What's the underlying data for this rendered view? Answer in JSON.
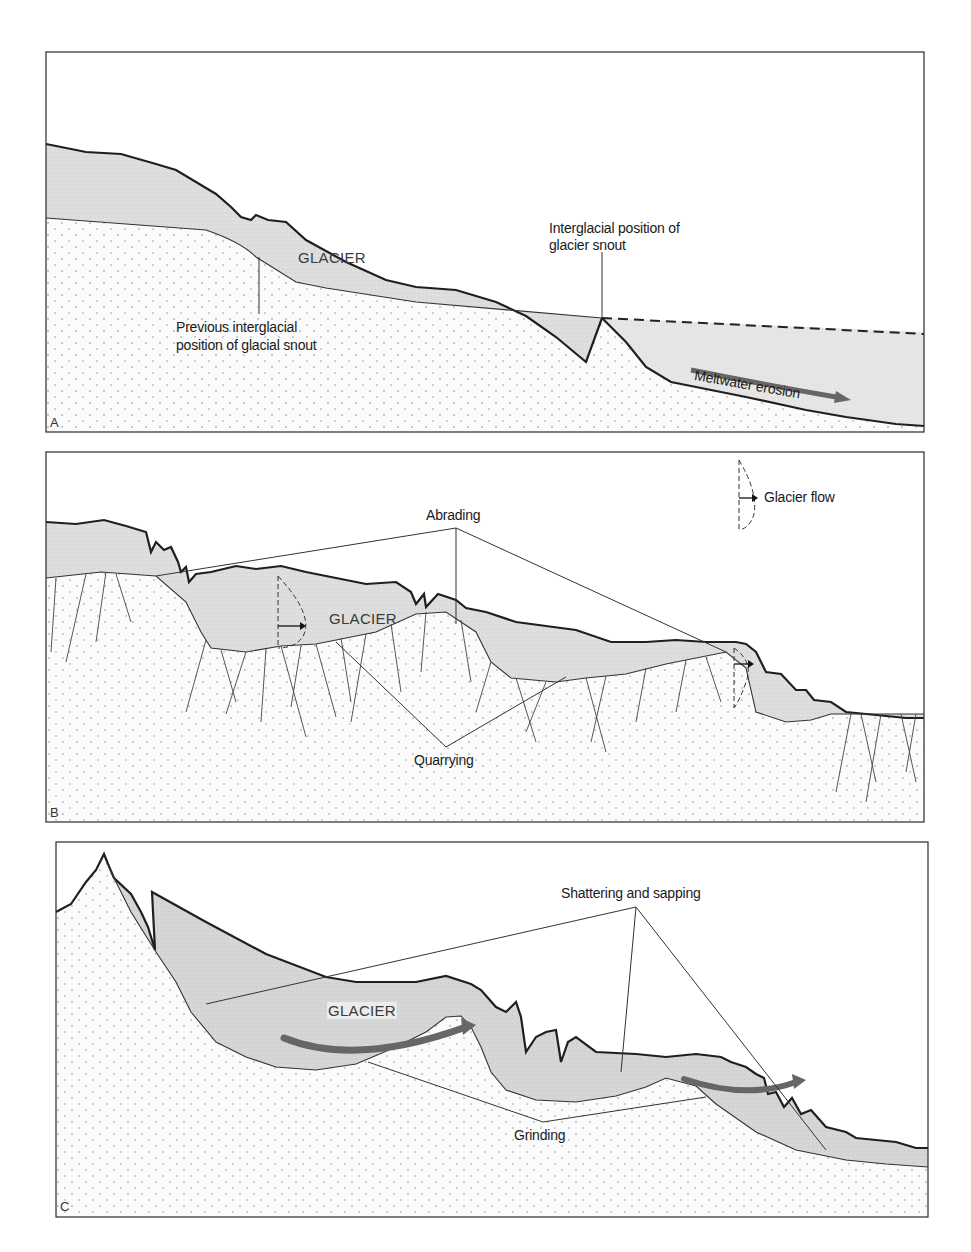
{
  "figure": {
    "colors": {
      "glacier_fill": "#dcdcdc",
      "rock_fill": "#fbfbfb",
      "rock_dots": "#7a7a7a",
      "line": "#1f1f1f",
      "arrow": "#6a6a6a"
    },
    "panels": [
      {
        "id": "A",
        "letter": "A",
        "glacier_label": "GLACIER",
        "annotations": {
          "interglacial_snout_line1": "Interglacial position of",
          "interglacial_snout_line2": "glacier snout",
          "previous_snout_line1": "Previous interglacial",
          "previous_snout_line2": "position of glacial snout",
          "meltwater": "Meltwater erosion"
        }
      },
      {
        "id": "B",
        "letter": "B",
        "glacier_label": "GLACIER",
        "annotations": {
          "abrading": "Abrading",
          "quarrying": "Quarrying",
          "legend_glacier_flow": "Glacier flow"
        }
      },
      {
        "id": "C",
        "letter": "C",
        "glacier_label": "GLACIER",
        "annotations": {
          "shattering": "Shattering and sapping",
          "grinding": "Grinding"
        }
      }
    ]
  }
}
